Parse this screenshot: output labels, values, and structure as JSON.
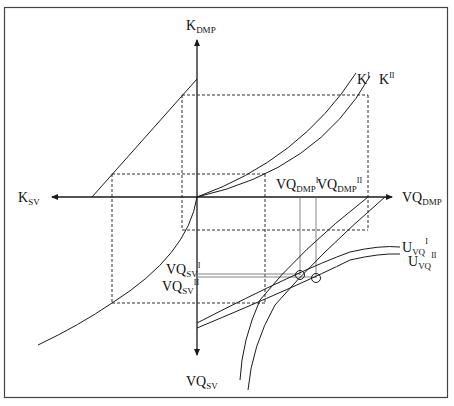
{
  "diagram": {
    "frame": {
      "stroke": "#444444"
    },
    "axes": {
      "up": {
        "main": "K",
        "sub": "DMP"
      },
      "left": {
        "main": "K",
        "sub": "SV"
      },
      "right": {
        "main": "VQ",
        "sub": "DMP"
      },
      "down": {
        "main": "VQ",
        "sub": "SV"
      }
    },
    "curves": {
      "k1": {
        "main": "K",
        "sup": "I"
      },
      "k2": {
        "main": "K",
        "sup": "II"
      },
      "u1": {
        "main": "U",
        "sub": "VQ",
        "sup": "I"
      },
      "u2": {
        "main": "U",
        "sub": "VQ",
        "sup": "II"
      }
    },
    "markers": {
      "vqdmp1": {
        "main": "VQ",
        "sub": "DMP",
        "sup": "I"
      },
      "vqdmp2": {
        "main": "VQ",
        "sub": "DMP",
        "sup": "II"
      },
      "vqsv1": {
        "main": "VQ",
        "sub": "SV",
        "sup": "I"
      },
      "vqsv2": {
        "main": "VQ",
        "sub": "SV",
        "sup": "II"
      }
    }
  }
}
